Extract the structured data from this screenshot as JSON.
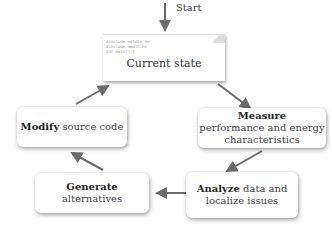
{
  "diagram": {
    "start_label": "Start",
    "current_state": {
      "code_lines": [
        "#include <stdio.h>",
        "#include <math.h>",
        "int main() {",
        "...",
        "}"
      ],
      "label": "Current state"
    },
    "measure": {
      "bold": "Measure",
      "rest": "performance and energy characteristics"
    },
    "analyze": {
      "bold": "Analyze",
      "rest": "data and localize issues"
    },
    "generate": {
      "bold": "Generate",
      "rest": "alternatives"
    },
    "modify": {
      "bold": "Modify",
      "rest": "source code"
    },
    "arrow_color": "#6b6b6b"
  }
}
